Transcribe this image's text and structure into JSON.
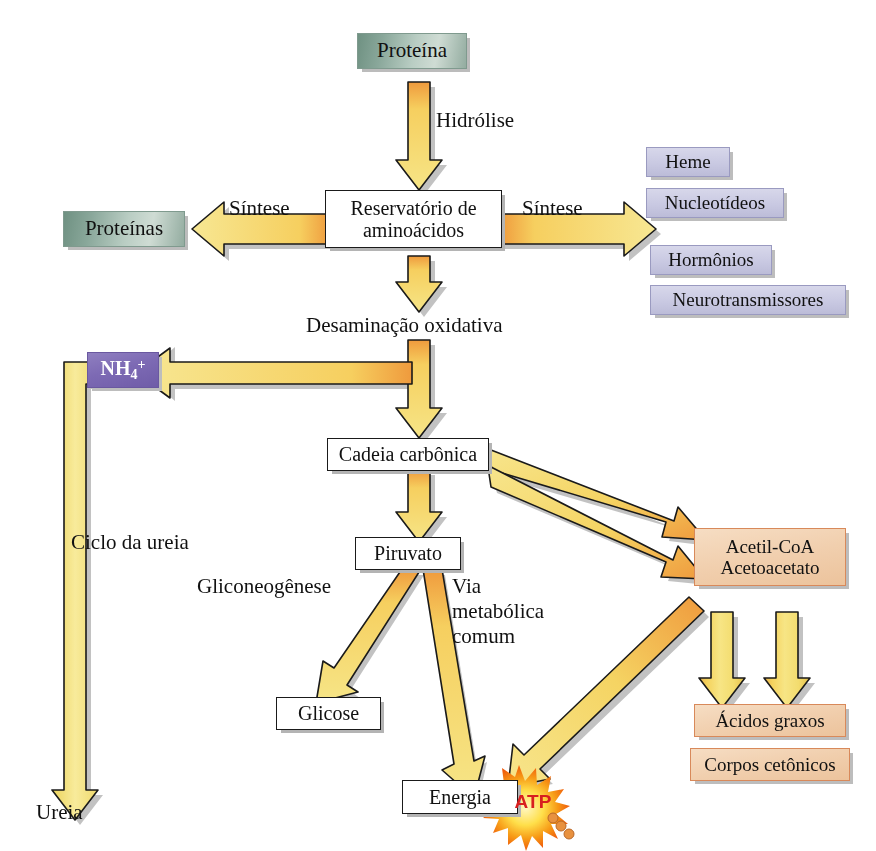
{
  "diagram": {
    "language": "pt-BR"
  },
  "colors": {
    "arrow_yellow": "#f5e06a",
    "arrow_orange": "#ef9a3d",
    "arrow_outline": "#1a1a1a",
    "shadow": "#b4b4b4",
    "protein_green": "#93aca0",
    "lavender": "#c9c9e2",
    "purple": "#7d6ab4",
    "peach": "#f1cfae",
    "peach_border": "#d8895a",
    "atp_red": "#d81f1f",
    "burst_yellow": "#ffe14d",
    "burst_orange": "#f26a1b",
    "text": "#111111"
  },
  "nodes": {
    "proteina": {
      "label": "Proteína",
      "style": "green"
    },
    "proteinas": {
      "label": "Proteínas",
      "style": "green"
    },
    "reservatorio": {
      "label_line1": "Reservatório de",
      "label_line2": "aminoácidos",
      "style": "plain"
    },
    "heme": {
      "label": "Heme",
      "style": "lavender"
    },
    "nucleotideos": {
      "label": "Nucleotídeos",
      "style": "lavender"
    },
    "hormonios": {
      "label": "Hormônios",
      "style": "lavender"
    },
    "neurotransmissores": {
      "label": "Neurotransmissores",
      "style": "lavender"
    },
    "amonio": {
      "label_base": "NH",
      "label_sub": "4",
      "label_sup": "+",
      "style": "purple"
    },
    "cadeia": {
      "label": "Cadeia carbônica",
      "style": "plain"
    },
    "piruvato": {
      "label": "Piruvato",
      "style": "plain"
    },
    "glicose": {
      "label": "Glicose",
      "style": "plain"
    },
    "energia": {
      "label": "Energia",
      "style": "plain"
    },
    "acetil": {
      "label_line1": "Acetil-CoA",
      "label_line2": "Acetoacetato",
      "style": "peach"
    },
    "acidos_graxos": {
      "label": "Ácidos graxos",
      "style": "peach"
    },
    "corpos_cetonicos": {
      "label": "Corpos cetônicos",
      "style": "peach"
    }
  },
  "labels": {
    "hidrolise": "Hidrólise",
    "sintese_esquerda": "Síntese",
    "sintese_direita": "Síntese",
    "desaminacao": "Desaminação oxidativa",
    "ciclo_ureia": "Ciclo da ureia",
    "ureia": "Ureia",
    "gliconeogenese": "Gliconeogênese",
    "via_metabolica_l1": "Via",
    "via_metabolica_l2": "metabólica",
    "via_metabolica_l3": "comum",
    "atp": "ATP"
  },
  "flows": [
    {
      "from": "proteina",
      "to": "reservatorio",
      "label": "Hidrólise",
      "direction": "down"
    },
    {
      "from": "reservatorio",
      "to": "proteinas",
      "label": "Síntese",
      "direction": "left"
    },
    {
      "from": "reservatorio",
      "to": "nucleotideos",
      "label": "Síntese",
      "direction": "right"
    },
    {
      "from": "reservatorio",
      "to": "cadeia",
      "label": "Desaminação oxidativa",
      "direction": "down"
    },
    {
      "from": "reservatorio",
      "to": "amonio",
      "label": "Desaminação oxidativa",
      "direction": "left"
    },
    {
      "from": "amonio",
      "to": "ureia",
      "label": "Ciclo da ureia",
      "direction": "down-left"
    },
    {
      "from": "cadeia",
      "to": "piruvato",
      "label": "",
      "direction": "down"
    },
    {
      "from": "cadeia",
      "to": "acetil",
      "label": "",
      "direction": "down-right"
    },
    {
      "from": "cadeia",
      "to": "acetil",
      "label": "",
      "direction": "down-right"
    },
    {
      "from": "piruvato",
      "to": "glicose",
      "label": "Gliconeogênese",
      "direction": "down-left"
    },
    {
      "from": "piruvato",
      "to": "energia",
      "label": "Via metabólica comum",
      "direction": "down-right"
    },
    {
      "from": "acetil",
      "to": "energia",
      "label": "",
      "direction": "down-left"
    },
    {
      "from": "acetil",
      "to": "acidos_graxos",
      "label": "",
      "direction": "down"
    },
    {
      "from": "acetil",
      "to": "acidos_graxos",
      "label": "",
      "direction": "down"
    }
  ]
}
